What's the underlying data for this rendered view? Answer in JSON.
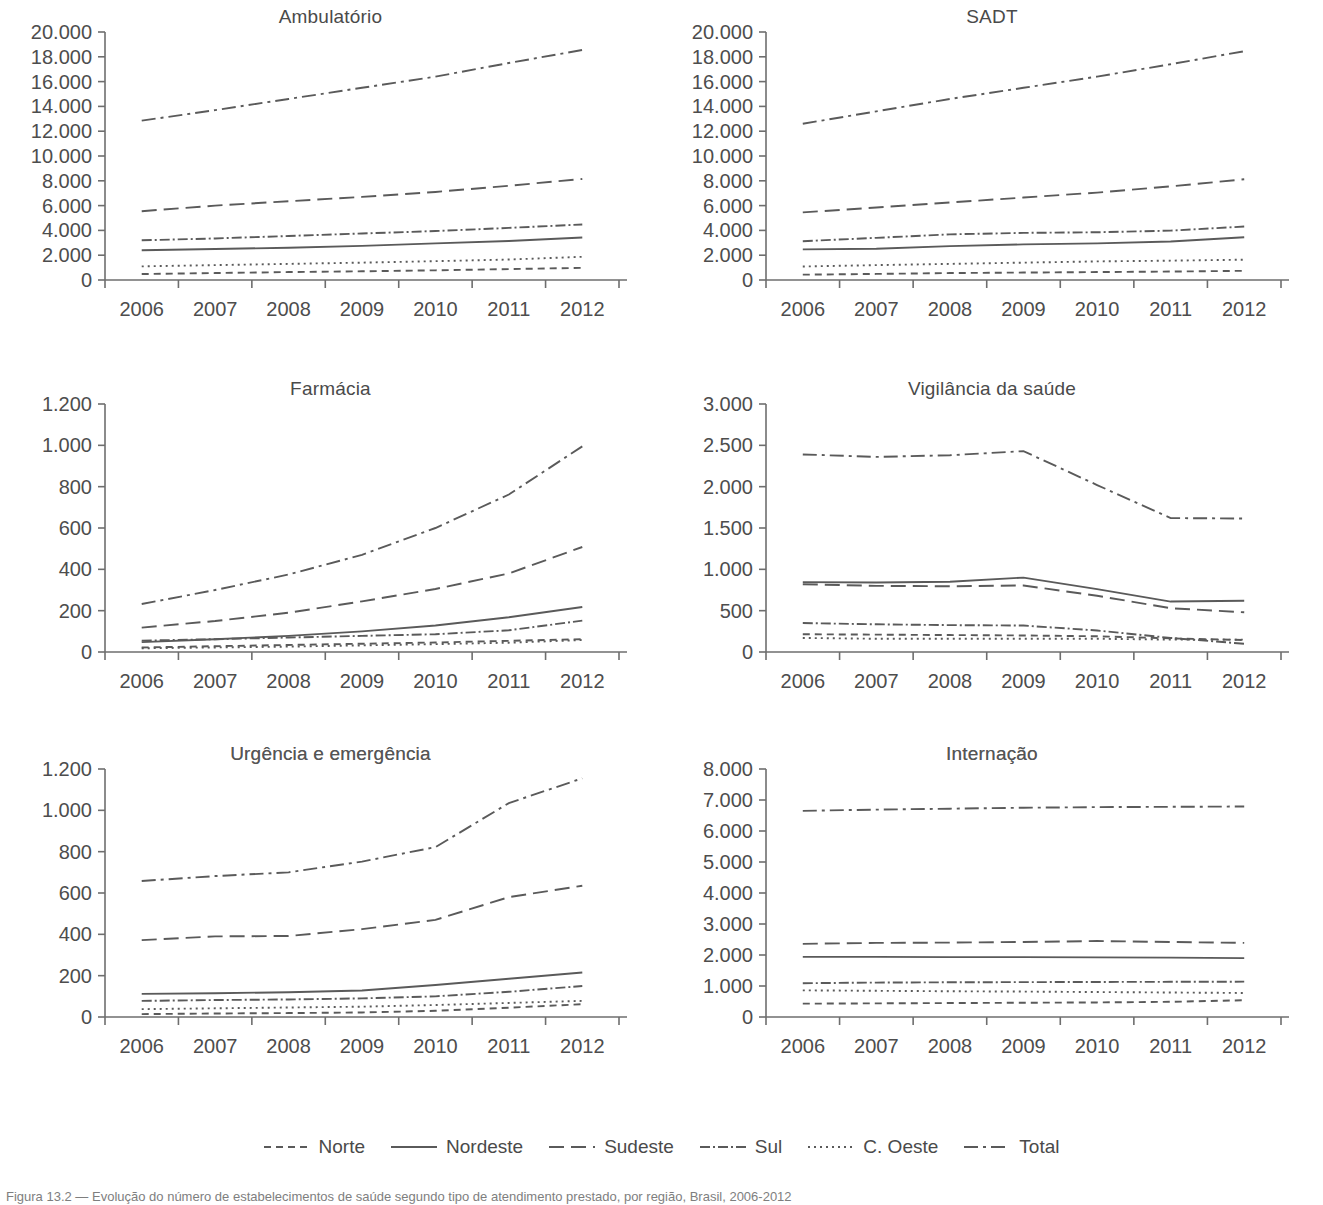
{
  "figure": {
    "caption": "Figura 13.2 — Evolução do número de estabelecimentos de saúde segundo tipo de atendimento prestado, por região, Brasil, 2006-2012",
    "legend_position": "bottom-center"
  },
  "legend": {
    "entries": [
      {
        "label": "Norte",
        "style": "dashed-short",
        "dash": "7,5",
        "key": "norte"
      },
      {
        "label": "Nordeste",
        "style": "solid",
        "dash": "none",
        "key": "nordeste"
      },
      {
        "label": "Sudeste",
        "style": "dashed-long",
        "dash": "15,7",
        "key": "sudeste"
      },
      {
        "label": "Sul",
        "style": "dash-dot-dense",
        "dash": "10,3,2,3",
        "key": "sul"
      },
      {
        "label": "C. Oeste",
        "style": "dotted",
        "dash": "2,4",
        "key": "coeste"
      },
      {
        "label": "Total",
        "style": "dash-dot",
        "dash": "14,5,3,5",
        "key": "total"
      }
    ]
  },
  "chart_data": [
    {
      "id": "ambulatorio",
      "type": "line",
      "title": "Ambulatório",
      "xlabel": "",
      "ylabel": "",
      "x": [
        2006,
        2007,
        2008,
        2009,
        2010,
        2011,
        2012
      ],
      "categories": [
        "2006",
        "2007",
        "2008",
        "2009",
        "2010",
        "2011",
        "2012"
      ],
      "ylim": [
        0,
        20000
      ],
      "yticks": [
        0,
        2000,
        4000,
        6000,
        8000,
        10000,
        12000,
        14000,
        16000,
        18000,
        20000
      ],
      "ytick_labels": [
        "0",
        "2.000",
        "4.000",
        "6.000",
        "8.000",
        "10.000",
        "12.000",
        "14.000",
        "16.000",
        "18.000",
        "20.000"
      ],
      "grid": false,
      "series": [
        {
          "name": "Norte",
          "values": [
            480,
            560,
            640,
            700,
            780,
            880,
            980
          ]
        },
        {
          "name": "Nordeste",
          "values": [
            2400,
            2500,
            2600,
            2750,
            2950,
            3150,
            3430
          ]
        },
        {
          "name": "Sudeste",
          "values": [
            5550,
            6000,
            6350,
            6700,
            7100,
            7600,
            8150
          ]
        },
        {
          "name": "Sul",
          "values": [
            3200,
            3350,
            3550,
            3750,
            3950,
            4200,
            4480
          ]
        },
        {
          "name": "C. Oeste",
          "values": [
            1100,
            1200,
            1300,
            1400,
            1520,
            1650,
            1870
          ]
        },
        {
          "name": "Total",
          "values": [
            12850,
            13700,
            14600,
            15500,
            16400,
            17500,
            18550
          ]
        }
      ]
    },
    {
      "id": "sadt",
      "type": "line",
      "title": "SADT",
      "xlabel": "",
      "ylabel": "",
      "x": [
        2006,
        2007,
        2008,
        2009,
        2010,
        2011,
        2012
      ],
      "categories": [
        "2006",
        "2007",
        "2008",
        "2009",
        "2010",
        "2011",
        "2012"
      ],
      "ylim": [
        0,
        20000
      ],
      "yticks": [
        0,
        2000,
        4000,
        6000,
        8000,
        10000,
        12000,
        14000,
        16000,
        18000,
        20000
      ],
      "ytick_labels": [
        "0",
        "2.000",
        "4.000",
        "6.000",
        "8.000",
        "10.000",
        "12.000",
        "14.000",
        "16.000",
        "18.000",
        "20.000"
      ],
      "grid": false,
      "series": [
        {
          "name": "Norte",
          "values": [
            430,
            490,
            560,
            600,
            640,
            680,
            740
          ]
        },
        {
          "name": "Nordeste",
          "values": [
            2470,
            2520,
            2730,
            2870,
            2950,
            3100,
            3450
          ]
        },
        {
          "name": "Sudeste",
          "values": [
            5450,
            5850,
            6250,
            6650,
            7050,
            7550,
            8120
          ]
        },
        {
          "name": "Sul",
          "values": [
            3130,
            3400,
            3680,
            3800,
            3850,
            3980,
            4310
          ]
        },
        {
          "name": "C. Oeste",
          "values": [
            1090,
            1200,
            1300,
            1400,
            1500,
            1560,
            1640
          ]
        },
        {
          "name": "Total",
          "values": [
            12600,
            13600,
            14600,
            15500,
            16400,
            17400,
            18450
          ]
        }
      ]
    },
    {
      "id": "farmacia",
      "type": "line",
      "title": "Farmácia",
      "xlabel": "",
      "ylabel": "",
      "x": [
        2006,
        2007,
        2008,
        2009,
        2010,
        2011,
        2012
      ],
      "categories": [
        "2006",
        "2007",
        "2008",
        "2009",
        "2010",
        "2011",
        "2012"
      ],
      "ylim": [
        0,
        1200
      ],
      "yticks": [
        0,
        200,
        400,
        600,
        800,
        1000,
        1200
      ],
      "ytick_labels": [
        "0",
        "200",
        "400",
        "600",
        "800",
        "1.000",
        "1.200"
      ],
      "grid": false,
      "series": [
        {
          "name": "Norte",
          "values": [
            22,
            28,
            34,
            40,
            46,
            54,
            62
          ]
        },
        {
          "name": "Nordeste",
          "values": [
            48,
            62,
            78,
            100,
            128,
            168,
            218
          ]
        },
        {
          "name": "Sudeste",
          "values": [
            118,
            150,
            190,
            245,
            305,
            380,
            508
          ]
        },
        {
          "name": "Sul",
          "values": [
            55,
            62,
            70,
            78,
            86,
            105,
            152
          ]
        },
        {
          "name": "C. Oeste",
          "values": [
            18,
            22,
            26,
            32,
            38,
            45,
            58
          ]
        },
        {
          "name": "Total",
          "values": [
            232,
            300,
            375,
            470,
            600,
            762,
            995
          ]
        }
      ]
    },
    {
      "id": "vigilancia",
      "type": "line",
      "title": "Vigilância da saúde",
      "xlabel": "",
      "ylabel": "",
      "x": [
        2006,
        2007,
        2008,
        2009,
        2010,
        2011,
        2012
      ],
      "categories": [
        "2006",
        "2007",
        "2008",
        "2009",
        "2010",
        "2011",
        "2012"
      ],
      "ylim": [
        0,
        3000
      ],
      "yticks": [
        0,
        500,
        1000,
        1500,
        2000,
        2500,
        3000
      ],
      "ytick_labels": [
        "0",
        "500",
        "1.000",
        "1.500",
        "2.000",
        "2.500",
        "3.000"
      ],
      "grid": false,
      "series": [
        {
          "name": "Norte",
          "values": [
            215,
            210,
            205,
            200,
            190,
            165,
            145
          ]
        },
        {
          "name": "Nordeste",
          "values": [
            845,
            840,
            850,
            900,
            760,
            610,
            620
          ]
        },
        {
          "name": "Sudeste",
          "values": [
            820,
            800,
            795,
            805,
            680,
            530,
            480
          ]
        },
        {
          "name": "Sul",
          "values": [
            350,
            335,
            325,
            320,
            260,
            170,
            100
          ]
        },
        {
          "name": "C. Oeste",
          "values": [
            170,
            160,
            160,
            160,
            160,
            150,
            150
          ]
        },
        {
          "name": "Total",
          "values": [
            2390,
            2360,
            2380,
            2430,
            2020,
            1620,
            1615
          ]
        }
      ]
    },
    {
      "id": "urgencia",
      "type": "line",
      "title": "Urgência e emergência",
      "xlabel": "",
      "ylabel": "",
      "x": [
        2006,
        2007,
        2008,
        2009,
        2010,
        2011,
        2012
      ],
      "categories": [
        "2006",
        "2007",
        "2008",
        "2009",
        "2010",
        "2011",
        "2012"
      ],
      "ylim": [
        0,
        1200
      ],
      "yticks": [
        0,
        200,
        400,
        600,
        800,
        1000,
        1200
      ],
      "ytick_labels": [
        "0",
        "200",
        "400",
        "600",
        "800",
        "1.000",
        "1.200"
      ],
      "grid": false,
      "series": [
        {
          "name": "Norte",
          "values": [
            14,
            17,
            19,
            22,
            30,
            45,
            62
          ]
        },
        {
          "name": "Nordeste",
          "values": [
            112,
            115,
            120,
            128,
            155,
            185,
            215
          ]
        },
        {
          "name": "Sudeste",
          "values": [
            372,
            390,
            392,
            425,
            470,
            580,
            635
          ]
        },
        {
          "name": "Sul",
          "values": [
            78,
            82,
            85,
            90,
            100,
            122,
            150
          ]
        },
        {
          "name": "C. Oeste",
          "values": [
            38,
            42,
            46,
            50,
            58,
            68,
            78
          ]
        },
        {
          "name": "Total",
          "values": [
            658,
            682,
            700,
            752,
            822,
            1035,
            1155
          ]
        }
      ]
    },
    {
      "id": "internacao",
      "type": "line",
      "title": "Internação",
      "xlabel": "",
      "ylabel": "",
      "x": [
        2006,
        2007,
        2008,
        2009,
        2010,
        2011,
        2012
      ],
      "categories": [
        "2006",
        "2007",
        "2008",
        "2009",
        "2010",
        "2011",
        "2012"
      ],
      "ylim": [
        0,
        8000
      ],
      "yticks": [
        0,
        1000,
        2000,
        3000,
        4000,
        5000,
        6000,
        7000,
        8000
      ],
      "ytick_labels": [
        "0",
        "1.000",
        "2.000",
        "3.000",
        "4.000",
        "5.000",
        "6.000",
        "7.000",
        "8.000"
      ],
      "grid": false,
      "series": [
        {
          "name": "Norte",
          "values": [
            430,
            440,
            450,
            460,
            470,
            490,
            540
          ]
        },
        {
          "name": "Nordeste",
          "values": [
            1940,
            1940,
            1930,
            1930,
            1925,
            1915,
            1900
          ]
        },
        {
          "name": "Sudeste",
          "values": [
            2360,
            2390,
            2400,
            2420,
            2450,
            2420,
            2390
          ]
        },
        {
          "name": "Sul",
          "values": [
            1090,
            1110,
            1120,
            1125,
            1130,
            1135,
            1140
          ]
        },
        {
          "name": "C. Oeste",
          "values": [
            860,
            845,
            830,
            820,
            805,
            790,
            775
          ]
        },
        {
          "name": "Total",
          "values": [
            6650,
            6690,
            6720,
            6750,
            6770,
            6780,
            6790
          ]
        }
      ]
    }
  ]
}
